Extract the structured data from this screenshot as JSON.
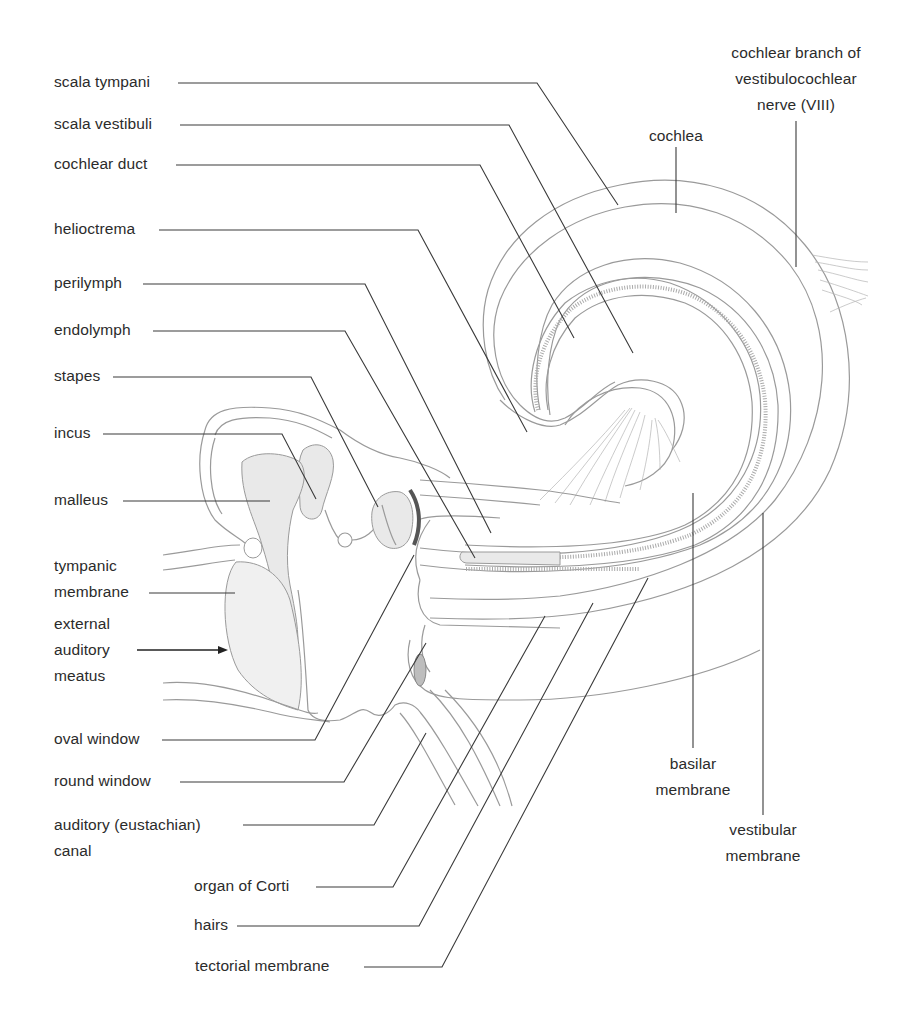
{
  "labels": {
    "scala_tympani": "scala tympani",
    "scala_vestibuli": "scala vestibuli",
    "cochlear_duct": "cochlear duct",
    "helicotrema": "helioctrema",
    "perilymph": "perilymph",
    "endolymph": "endolymph",
    "stapes": "stapes",
    "incus": "incus",
    "malleus": "malleus",
    "tympanic_membrane": "tympanic\nmembrane",
    "external_auditory_meatus": "external\nauditory\nmeatus",
    "oval_window": "oval window",
    "round_window": "round window",
    "auditory_canal": "auditory (eustachian)\ncanal",
    "organ_of_corti": "organ of Corti",
    "hairs": "hairs",
    "tectorial_membrane": "tectorial membrane",
    "cochlea": "cochlea",
    "cochlear_nerve": "cochlear branch of\nvestibulocochlear\nnerve (VIII)",
    "basilar_membrane": "basilar\nmembrane",
    "vestibular_membrane": "vestibular\nmembrane"
  },
  "arrow": {
    "direction": "right",
    "meaning": "sound entering external auditory meatus"
  },
  "colors": {
    "text": "#2b2b2b",
    "leader_line": "#3a3a3a",
    "drawing": "#9a9a9a",
    "background": "#ffffff"
  }
}
